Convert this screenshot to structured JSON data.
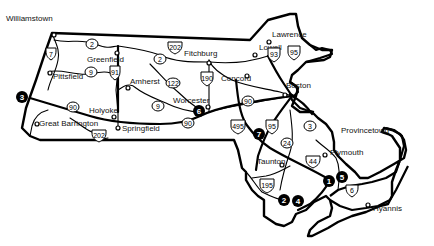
{
  "map": {
    "towns": [
      {
        "name": "Williamstown",
        "x": 6,
        "y": 21
      },
      {
        "name": "Greenfield",
        "x": 87,
        "y": 59
      },
      {
        "name": "Pittsfield",
        "x": 38,
        "y": 79
      },
      {
        "name": "Amherst",
        "x": 130,
        "y": 85
      },
      {
        "name": "Fitchburg",
        "x": 184,
        "y": 56
      },
      {
        "name": "Lowell",
        "x": 259,
        "y": 49
      },
      {
        "name": "Lawrence",
        "x": 272,
        "y": 33
      },
      {
        "name": "Concord",
        "x": 221,
        "y": 81
      },
      {
        "name": "Boston",
        "x": 286,
        "y": 88
      },
      {
        "name": "Worcester",
        "x": 173,
        "y": 103
      },
      {
        "name": "Holyoke",
        "x": 89,
        "y": 113
      },
      {
        "name": "Great Barrington",
        "x": 39,
        "y": 126
      },
      {
        "name": "Springfield",
        "x": 122,
        "y": 128
      },
      {
        "name": "Provincetown",
        "x": 341,
        "y": 133
      },
      {
        "name": "Plymouth",
        "x": 330,
        "y": 155
      },
      {
        "name": "Taunton",
        "x": 267,
        "y": 163
      },
      {
        "name": "Hyannis",
        "x": 375,
        "y": 208
      }
    ],
    "route_shields": [
      {
        "number": "7",
        "type": "us",
        "x": 51,
        "y": 54
      },
      {
        "number": "2",
        "type": "state",
        "x": 92,
        "y": 46
      },
      {
        "number": "9",
        "type": "state",
        "x": 90,
        "y": 74
      },
      {
        "number": "91",
        "type": "interstate",
        "x": 115,
        "y": 74
      },
      {
        "number": "202",
        "type": "us",
        "x": 175,
        "y": 49
      },
      {
        "number": "2",
        "type": "state",
        "x": 160,
        "y": 59
      },
      {
        "number": "122",
        "type": "state",
        "x": 173,
        "y": 84
      },
      {
        "number": "190",
        "type": "interstate",
        "x": 207,
        "y": 80
      },
      {
        "number": "9",
        "type": "state",
        "x": 158,
        "y": 106
      },
      {
        "number": "90",
        "type": "state",
        "x": 73,
        "y": 107
      },
      {
        "number": "202",
        "type": "us",
        "x": 99,
        "y": 137
      },
      {
        "number": "90",
        "type": "state",
        "x": 188,
        "y": 123
      },
      {
        "number": "90",
        "type": "state",
        "x": 248,
        "y": 101
      },
      {
        "number": "93",
        "type": "interstate",
        "x": 274,
        "y": 55
      },
      {
        "number": "95",
        "type": "interstate",
        "x": 294,
        "y": 53
      },
      {
        "number": "495",
        "type": "interstate",
        "x": 238,
        "y": 128
      },
      {
        "number": "95",
        "type": "interstate",
        "x": 272,
        "y": 128
      },
      {
        "number": "3",
        "type": "state",
        "x": 310,
        "y": 126
      },
      {
        "number": "24",
        "type": "state",
        "x": 287,
        "y": 143
      },
      {
        "number": "44",
        "type": "us",
        "x": 313,
        "y": 162
      },
      {
        "number": "195",
        "type": "interstate",
        "x": 267,
        "y": 186
      },
      {
        "number": "6",
        "type": "us",
        "x": 352,
        "y": 191
      }
    ],
    "markers": [
      {
        "number": "1",
        "x": 329,
        "y": 181
      },
      {
        "number": "2",
        "x": 284,
        "y": 200
      },
      {
        "number": "3",
        "x": 22,
        "y": 97
      },
      {
        "number": "4",
        "x": 298,
        "y": 201
      },
      {
        "number": "5",
        "x": 342,
        "y": 177
      },
      {
        "number": "6",
        "x": 199,
        "y": 111
      },
      {
        "number": "7",
        "x": 259,
        "y": 134
      }
    ]
  }
}
